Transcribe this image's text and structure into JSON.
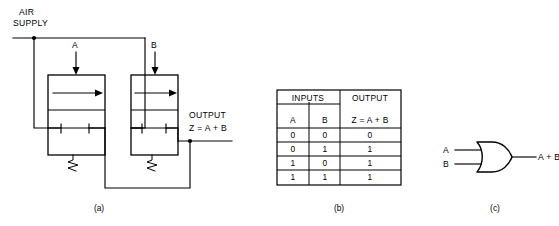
{
  "figure": {
    "panels": [
      {
        "id": "a",
        "caption": "(a)",
        "kind": "pneumatic-circuit"
      },
      {
        "id": "b",
        "caption": "(b)",
        "kind": "truth-table"
      },
      {
        "id": "c",
        "caption": "(c)",
        "kind": "logic-symbol"
      }
    ]
  },
  "circuit": {
    "supply_label_line1": "AIR",
    "supply_label_line2": "SUPPLY",
    "input_a_label": "A",
    "input_b_label": "B",
    "output_label_line1": "OUTPUT",
    "output_label_line2": "Z = A + B",
    "valves": [
      {
        "name": "valve-a",
        "actuator_label": "A",
        "spring_return": true
      },
      {
        "name": "valve-b",
        "actuator_label": "B",
        "spring_return": true
      }
    ],
    "stroke_color": "#000000"
  },
  "truth_table": {
    "group_headers": [
      "INPUTS",
      "OUTPUT"
    ],
    "columns": [
      "A",
      "B",
      "Z = A + B"
    ],
    "rows": [
      [
        "0",
        "0",
        "0"
      ],
      [
        "0",
        "1",
        "1"
      ],
      [
        "1",
        "0",
        "1"
      ],
      [
        "1",
        "1",
        "1"
      ]
    ]
  },
  "logic_symbol": {
    "gate_type": "OR",
    "input_labels": [
      "A",
      "B"
    ],
    "output_label": "A + B"
  },
  "captions": {
    "a": "(a)",
    "b": "(b)",
    "c": "(c)"
  }
}
